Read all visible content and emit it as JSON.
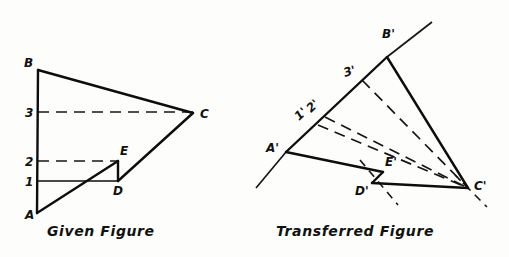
{
  "page": {
    "background_color": "#fdfdfb",
    "ink_color": "#0d0d0d",
    "width": 509,
    "height": 257
  },
  "given_figure": {
    "caption": "Given Figure",
    "caption_pos": {
      "x": 47,
      "y": 236
    },
    "vertices": {
      "A": {
        "label": "A",
        "x": 37,
        "y": 213,
        "label_x": 25,
        "label_y": 219
      },
      "B": {
        "label": "B",
        "x": 38,
        "y": 70,
        "label_x": 24,
        "label_y": 67
      },
      "C": {
        "label": "C",
        "x": 193,
        "y": 113,
        "label_x": 200,
        "label_y": 118
      },
      "D": {
        "label": "D",
        "x": 118,
        "y": 181,
        "label_x": 113,
        "label_y": 195
      },
      "E": {
        "label": "E",
        "x": 118,
        "y": 161,
        "label_x": 120,
        "label_y": 155
      }
    },
    "reference_lines": [
      {
        "label": "1",
        "y": 181,
        "x_start": 38,
        "x_end": 118,
        "style": "solid",
        "label_x": 25,
        "label_y": 186
      },
      {
        "label": "2",
        "y": 161,
        "x_start": 38,
        "x_end": 118,
        "style": "dashed",
        "label_x": 25,
        "label_y": 166
      },
      {
        "label": "3",
        "y": 112,
        "x_start": 38,
        "x_end": 193,
        "style": "dashed",
        "label_x": 25,
        "label_y": 117
      }
    ],
    "edges": [
      {
        "name": "A-B",
        "from": "A",
        "to": "B"
      },
      {
        "name": "B-C",
        "from": "B",
        "to": "C"
      },
      {
        "name": "C-D",
        "from": "C",
        "to": "D"
      },
      {
        "name": "D-E",
        "from": "D",
        "to": "E"
      },
      {
        "name": "E-A",
        "from": "E",
        "to": "A"
      }
    ]
  },
  "transferred_figure": {
    "caption": "Transferred   Figure",
    "caption_pos": {
      "x": 276,
      "y": 236
    },
    "vertices": {
      "A'": {
        "label": "A'",
        "x": 286,
        "y": 152,
        "label_x": 266,
        "label_y": 152
      },
      "B'": {
        "label": "B'",
        "x": 387,
        "y": 57,
        "label_x": 382,
        "label_y": 38
      },
      "C'": {
        "label": "C'",
        "x": 468,
        "y": 188,
        "label_x": 474,
        "label_y": 190
      },
      "D'": {
        "label": "D'",
        "x": 372,
        "y": 183,
        "label_x": 355,
        "label_y": 195
      },
      "E'": {
        "label": "E'",
        "x": 383,
        "y": 172,
        "label_x": 385,
        "label_y": 166
      }
    },
    "reference_points": [
      {
        "label": "1'",
        "x": 318,
        "y": 125,
        "label_x": 299,
        "label_y": 121
      },
      {
        "label": "2'",
        "x": 325,
        "y": 117,
        "label_x": 311,
        "label_y": 113
      },
      {
        "label": "3'",
        "x": 362,
        "y": 80,
        "label_x": 345,
        "label_y": 77
      }
    ],
    "axis_line": {
      "name": "ground-axis-through-A'-B'",
      "x1": 256,
      "y1": 188,
      "x2": 432,
      "y2": 22
    },
    "edges": [
      {
        "name": "A'-B'",
        "from": "A'",
        "to": "B'"
      },
      {
        "name": "B'-C'",
        "from": "B'",
        "to": "C'"
      },
      {
        "name": "C'-D'",
        "from": "C'",
        "to": "D'"
      },
      {
        "name": "D'-E'",
        "from": "D'",
        "to": "E'"
      },
      {
        "name": "E'-A'",
        "from": "E'",
        "to": "A'"
      }
    ],
    "projectors": [
      {
        "name": "projector-3'-to-C'",
        "from": "3'",
        "to": "C'",
        "style": "dashed"
      },
      {
        "name": "projector-2'-to-C'",
        "from": "2'",
        "to": "E'-C'",
        "style": "dashed"
      },
      {
        "name": "projector-1'-to-C'",
        "from": "1'",
        "to": "D'-C'",
        "style": "dashed"
      }
    ]
  }
}
